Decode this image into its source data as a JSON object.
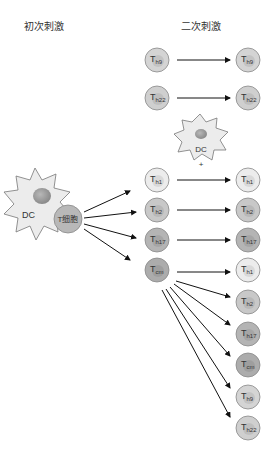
{
  "headers": {
    "primary": "初次刺激",
    "secondary": "二次刺激"
  },
  "primary": {
    "dc_label": "DC",
    "tcell_label": "T细胞"
  },
  "secondary_dc": {
    "label": "DC",
    "plus": "+"
  },
  "left_cells": [
    {
      "main": "T",
      "sub": "h9",
      "x": 157,
      "y": 60,
      "fill": "#d4d4d4"
    },
    {
      "main": "T",
      "sub": "h22",
      "x": 157,
      "y": 98,
      "fill": "#cfcfcf"
    },
    {
      "main": "T",
      "sub": "h1",
      "x": 157,
      "y": 180,
      "fill": "#ececec"
    },
    {
      "main": "T",
      "sub": "h2",
      "x": 157,
      "y": 210,
      "fill": "#c8c8c8"
    },
    {
      "main": "T",
      "sub": "h17",
      "x": 157,
      "y": 240,
      "fill": "#b4b4b4"
    },
    {
      "main": "T",
      "sub": "cm",
      "x": 157,
      "y": 270,
      "fill": "#acacac"
    }
  ],
  "right_cells": [
    {
      "main": "T",
      "sub": "h9",
      "x": 248,
      "y": 60,
      "fill": "#d4d4d4"
    },
    {
      "main": "T",
      "sub": "h22",
      "x": 248,
      "y": 98,
      "fill": "#cfcfcf"
    },
    {
      "main": "T",
      "sub": "h1",
      "x": 248,
      "y": 180,
      "fill": "#ececec"
    },
    {
      "main": "T",
      "sub": "h2",
      "x": 248,
      "y": 210,
      "fill": "#c8c8c8"
    },
    {
      "main": "T",
      "sub": "h17",
      "x": 248,
      "y": 240,
      "fill": "#b4b4b4"
    },
    {
      "main": "T",
      "sub": "h1",
      "x": 248,
      "y": 270,
      "fill": "#ececec"
    },
    {
      "main": "T",
      "sub": "h2",
      "x": 248,
      "y": 302,
      "fill": "#c8c8c8"
    },
    {
      "main": "T",
      "sub": "h17",
      "x": 248,
      "y": 334,
      "fill": "#b4b4b4"
    },
    {
      "main": "T",
      "sub": "cm",
      "x": 248,
      "y": 365,
      "fill": "#acacac"
    },
    {
      "main": "T",
      "sub": "h9",
      "x": 248,
      "y": 397,
      "fill": "#d4d4d4"
    },
    {
      "main": "T",
      "sub": "h22",
      "x": 248,
      "y": 428,
      "fill": "#cfcfcf"
    }
  ],
  "colors": {
    "arrow": "#111111",
    "dc_fill": "#ececec",
    "dc_stroke": "#777777",
    "cell_stroke": "#888888"
  }
}
